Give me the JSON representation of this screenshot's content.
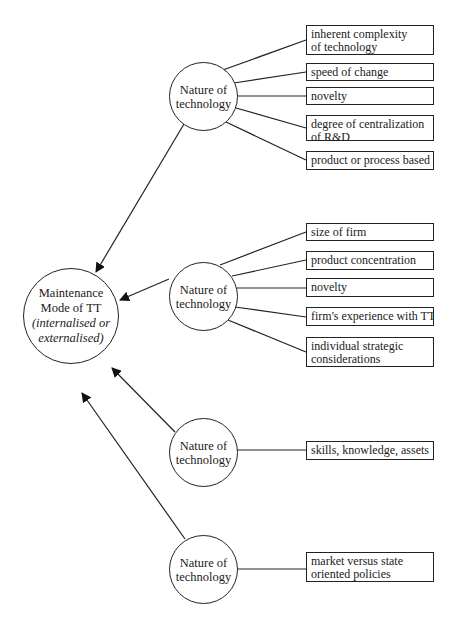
{
  "diagram": {
    "central_node": {
      "line1": "Maintenance",
      "line2": "Mode of TT",
      "line3": "(internalised or",
      "line4": "externalised)"
    },
    "clusters": [
      {
        "label_line1": "Nature of",
        "label_line2": "technology",
        "factors": [
          {
            "line1": "inherent complexity",
            "line2": "of technology"
          },
          {
            "line1": "speed of change",
            "line2": ""
          },
          {
            "line1": "novelty",
            "line2": ""
          },
          {
            "line1": "degree of centralization",
            "line2": "of R&D"
          },
          {
            "line1": "product or process based",
            "line2": ""
          }
        ]
      },
      {
        "label_line1": "Nature of",
        "label_line2": "technology",
        "factors": [
          {
            "line1": "size of firm",
            "line2": ""
          },
          {
            "line1": "product concentration",
            "line2": ""
          },
          {
            "line1": "novelty",
            "line2": ""
          },
          {
            "line1": "firm's experience with TT",
            "line2": ""
          },
          {
            "line1": "individual strategic",
            "line2": "considerations"
          }
        ]
      },
      {
        "label_line1": "Nature of",
        "label_line2": "technology",
        "factors": [
          {
            "line1": "skills, knowledge, assets",
            "line2": ""
          }
        ]
      },
      {
        "label_line1": "Nature of",
        "label_line2": "technology",
        "factors": [
          {
            "line1": "market versus state",
            "line2": "oriented policies"
          }
        ]
      }
    ],
    "colors": {
      "line": "#222222",
      "background": "#ffffff"
    }
  }
}
